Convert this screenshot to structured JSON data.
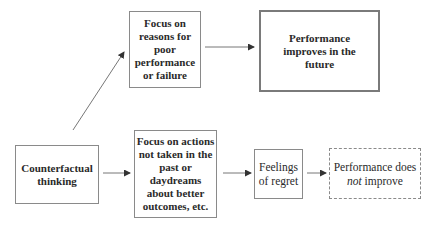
{
  "diagram": {
    "nodes": {
      "counterfactual": {
        "label": "Counterfactual thinking",
        "line1": "Counterfactual",
        "line2": "thinking"
      },
      "focus_reasons": {
        "label": "Focus on reasons for poor performance or failure",
        "line1": "Focus on",
        "line2": "reasons for",
        "line3": "poor",
        "line4": "performance",
        "line5": "or failure"
      },
      "improves": {
        "label": "Performance improves in the future",
        "line1": "Performance",
        "line2": "improves in the",
        "line3": "future"
      },
      "focus_actions": {
        "label": "Focus on actions not taken in the past or daydreams about better outcomes, etc.",
        "line1": "Focus on actions",
        "line2": "not taken in the",
        "line3": "past or",
        "line4": "daydreams",
        "line5": "about better",
        "line6": "outcomes, etc."
      },
      "regret": {
        "label": "Feelings of regret",
        "line1": "Feelings",
        "line2": "of regret"
      },
      "not_improve": {
        "label": "Performance does not improve",
        "line1": "Performance does",
        "line2_em": "not",
        "line2_rest": " improve"
      }
    },
    "edges": [
      {
        "from": "counterfactual",
        "to": "focus_reasons"
      },
      {
        "from": "focus_reasons",
        "to": "improves"
      },
      {
        "from": "counterfactual",
        "to": "focus_actions"
      },
      {
        "from": "focus_actions",
        "to": "regret"
      },
      {
        "from": "regret",
        "to": "not_improve"
      }
    ],
    "colors": {
      "border": "#8a8a8a",
      "text": "#2a2a2a",
      "arrow": "#555555"
    }
  }
}
